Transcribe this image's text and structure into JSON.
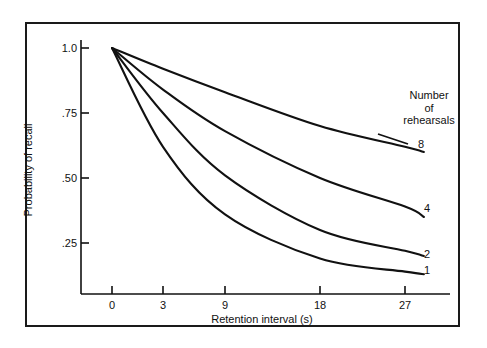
{
  "figure": {
    "background_color": "#ffffff",
    "frame_color": "#1a1a1a",
    "curve_color": "#111111"
  },
  "chart_data": {
    "type": "line",
    "title": "",
    "subtitle": "",
    "xlabel": "Retention interval (s)",
    "ylabel": "Probability of recall",
    "grid": false,
    "legend_position": "right-inline",
    "legend_title": "Number of rehearsals",
    "xticks": [
      0,
      3,
      9,
      18,
      27
    ],
    "xtick_labels": [
      "0",
      "3",
      "9",
      "18",
      "27"
    ],
    "xtick_pixel_x": [
      112,
      163,
      225,
      320,
      405
    ],
    "yticks": [
      0.25,
      0.5,
      0.75,
      1.0
    ],
    "ytick_labels": [
      ".25",
      ".50",
      ".75",
      "1.0"
    ],
    "ylim": [
      0.0,
      1.05
    ],
    "xlim": [
      0,
      30
    ],
    "x_scale_note": "non-linear (compressed) retention-interval axis: 0, 3, 9, 18, 27 s",
    "x": [
      0,
      3,
      9,
      18,
      27,
      29
    ],
    "series": [
      {
        "name": "8",
        "label": "8",
        "legend_entry": "8 rehearsals",
        "values": [
          1.0,
          0.92,
          0.83,
          0.7,
          0.62,
          0.6
        ]
      },
      {
        "name": "4",
        "label": "4",
        "legend_entry": "4 rehearsals",
        "values": [
          1.0,
          0.84,
          0.68,
          0.5,
          0.39,
          0.35
        ]
      },
      {
        "name": "2",
        "label": "2",
        "legend_entry": "2 rehearsals",
        "values": [
          1.0,
          0.75,
          0.51,
          0.3,
          0.22,
          0.2
        ]
      },
      {
        "name": "1",
        "label": "1",
        "legend_entry": "1 rehearsal",
        "values": [
          1.0,
          0.62,
          0.36,
          0.19,
          0.14,
          0.13
        ]
      }
    ]
  },
  "axes": {
    "y_title": "Probability of recall",
    "x_title": "Retention interval (s)",
    "y_labels": [
      {
        "text": "1.0",
        "value": 1.0
      },
      {
        "text": ".75",
        "value": 0.75
      },
      {
        "text": ".50",
        "value": 0.5
      },
      {
        "text": ".25",
        "value": 0.25
      }
    ],
    "x_labels": [
      {
        "text": "0",
        "value": 0
      },
      {
        "text": "3",
        "value": 3
      },
      {
        "text": "9",
        "value": 9
      },
      {
        "text": "18",
        "value": 18
      },
      {
        "text": "27",
        "value": 27
      }
    ]
  },
  "legend": {
    "line1": "Number",
    "line2": "of",
    "line3": "rehearsals",
    "full": "Number of rehearsals",
    "series_labels": [
      "8",
      "4",
      "2",
      "1"
    ]
  }
}
